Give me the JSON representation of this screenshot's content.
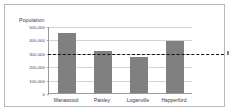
{
  "chart_data": {
    "type": "bar",
    "title": "",
    "xlabel": "",
    "ylabel": "Population",
    "categories": [
      "Manawood",
      "Paisley",
      "Loganville",
      "Happerford"
    ],
    "values": [
      450000,
      315000,
      270000,
      385000
    ],
    "ylim": [
      0,
      500000
    ],
    "yticks": [
      0,
      100000,
      200000,
      300000,
      400000,
      500000
    ],
    "ytick_labels": [
      "0",
      "100,000",
      "200,000",
      "300,000",
      "400,000",
      "500,000"
    ],
    "grid": true,
    "legend": "none",
    "bar_color": "#808080",
    "annotations": [
      {
        "name": "minimum-level",
        "label": "Minimum level",
        "type": "horizontal-reference-line",
        "value": 300000,
        "style": "dashed",
        "color": "#111111"
      }
    ]
  },
  "axis": {
    "y_title": "Population"
  },
  "colors": {
    "bar": "#808080",
    "grid": "#d3d3d3",
    "axis": "#9a9a9a",
    "frame": "#b9b9b9",
    "threshold": "#111111",
    "text": "#3b3b3b"
  }
}
